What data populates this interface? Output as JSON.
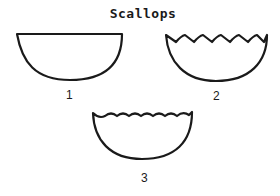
{
  "title": "Scallops",
  "figures": [
    {
      "id": "1",
      "label": "1",
      "edge": "plain"
    },
    {
      "id": "2",
      "label": "2",
      "edge": "pointed scallops"
    },
    {
      "id": "3",
      "label": "3",
      "edge": "rounded scallops"
    }
  ],
  "colors": {
    "ink": "#1a1a1a",
    "background": "#ffffff"
  }
}
